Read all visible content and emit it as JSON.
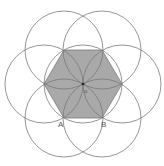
{
  "diagram": {
    "type": "geometric-construction",
    "colors": {
      "background": "#ffffff",
      "stroke": "#7a7a7a",
      "hexagon_fill": "#a9a9a9",
      "label": "#555555"
    },
    "center": {
      "x": 83,
      "y": 84
    },
    "radius": 39,
    "hexagon_vertices": [
      {
        "x": 64,
        "y": 50
      },
      {
        "x": 102,
        "y": 50
      },
      {
        "x": 122,
        "y": 84
      },
      {
        "x": 102,
        "y": 118
      },
      {
        "x": 64,
        "y": 118
      },
      {
        "x": 44,
        "y": 84
      }
    ],
    "labels": {
      "A": "A",
      "B": "B",
      "center": "o"
    }
  }
}
